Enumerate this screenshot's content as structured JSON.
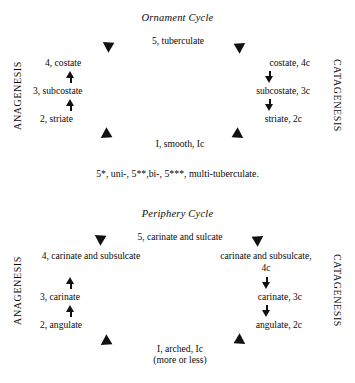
{
  "figure": {
    "cycles": [
      {
        "id": "ornament",
        "title": "Ornament Cycle",
        "left_axis_label": "ANAGENESIS",
        "right_axis_label": "CATAGENESIS",
        "top_node": "5, tuberculate",
        "bottom_node": "I, smooth, Ic",
        "bottom_node_sub": "",
        "left_stages": [
          "4, costate",
          "3, subcostate",
          "2, striate"
        ],
        "right_stages": [
          "costate, 4c",
          "subcostate, 3c",
          "striate, 2c"
        ],
        "footnote": "5*, uni-, 5**,bi-, 5***, multi-tuberculate."
      },
      {
        "id": "periphery",
        "title": "Periphery Cycle",
        "left_axis_label": "ANAGENESIS",
        "right_axis_label": "CATAGENESIS",
        "top_node": "5, carinate and sulcate",
        "bottom_node": "I, arched, Ic",
        "bottom_node_sub": "(more or less)",
        "left_stages": [
          "4, carinate and\nsubsulcate",
          "3, carinate",
          "2, angulate"
        ],
        "right_stages": [
          "carinate and\nsubsulcate, 4c",
          "carinate, 3c",
          "angulate, 2c"
        ],
        "footnote": ""
      }
    ],
    "arrow_icons": {
      "up": "arrow-up-icon",
      "down": "arrow-down-icon",
      "diagonal": "arrowhead-icon"
    },
    "colors": {
      "ink": "#0b0b0b",
      "background": "#ffffff"
    }
  }
}
